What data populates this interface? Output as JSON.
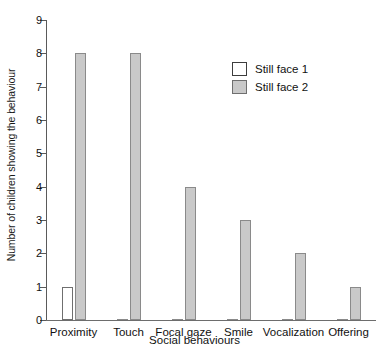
{
  "chart_data": {
    "type": "bar",
    "title": "",
    "xlabel": "Social behaviours",
    "ylabel": "Number of children showing the behaviour",
    "categories": [
      "Proximity",
      "Touch",
      "Focal gaze",
      "Smile",
      "Vocalization",
      "Offering"
    ],
    "series": [
      {
        "name": "Still face 1",
        "values": [
          1,
          0,
          0,
          0,
          0,
          0
        ],
        "fill": "#ffffff"
      },
      {
        "name": "Still face 2",
        "values": [
          8,
          8,
          4,
          3,
          2,
          1
        ],
        "fill": "#c9c9c9"
      }
    ],
    "ylim": [
      0,
      9
    ],
    "yticks": [
      0,
      1,
      2,
      3,
      4,
      5,
      6,
      7,
      8,
      9
    ],
    "ytick_labels": [
      "0",
      "1",
      "2",
      "3",
      "4",
      "5",
      "6",
      "7",
      "8",
      "9"
    ],
    "grid": false,
    "legend_position": "top-right"
  },
  "legend": {
    "entries": [
      {
        "label": "Still face 1",
        "style": "open"
      },
      {
        "label": "Still face 2",
        "style": "filled"
      }
    ]
  }
}
